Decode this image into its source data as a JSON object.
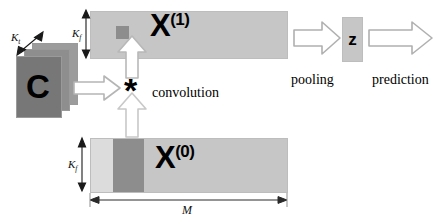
{
  "diagram": {
    "filters": {
      "label": "C",
      "depth_label": "K",
      "depth_sub": "t",
      "name": "filter-stack",
      "plate_count": 3
    },
    "feature_maps": [
      {
        "id": "x1",
        "label": "X",
        "superscript": "(1)",
        "height_label": "K",
        "height_sub": "f",
        "fill": "#c6c6c6",
        "patch_fill": "#8d8d8d"
      },
      {
        "id": "x0",
        "label": "X",
        "superscript": "(0)",
        "height_label": "K",
        "height_sub": "f",
        "width_label": "M",
        "fill": "#c6c6c6",
        "band_fill": "#8d8d8d",
        "strip_fill": "#dcdcdc"
      }
    ],
    "operators": [
      {
        "symbol": "*",
        "name": "convolution-operator"
      }
    ],
    "captions": [
      {
        "text": "convolution",
        "name": "convolution-caption"
      },
      {
        "text": "pooling",
        "name": "pooling-caption"
      },
      {
        "text": "prediction",
        "name": "prediction-caption"
      }
    ],
    "output": {
      "label": "z",
      "name": "z-vector",
      "fill": "#c6c6c6"
    },
    "arrows": [
      {
        "name": "arrow-filters-to-operator",
        "direction": "right"
      },
      {
        "name": "arrow-input-to-operator",
        "direction": "up"
      },
      {
        "name": "arrow-operator-to-output-map",
        "direction": "up"
      },
      {
        "name": "arrow-pooling",
        "direction": "right"
      },
      {
        "name": "arrow-prediction",
        "direction": "right"
      }
    ],
    "colors": {
      "map_fill": "#c6c6c6",
      "dark_fill": "#8d8d8d",
      "light_fill": "#dcdcdc",
      "arrow_stroke": "#9e9e9e",
      "arrow_fill": "#ffffff",
      "text": "#000000"
    }
  }
}
